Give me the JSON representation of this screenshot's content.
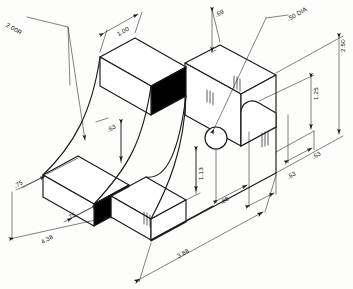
{
  "drawing": {
    "type": "isometric-engineering-drawing",
    "title": "Isometric pictorial of curved bracket with dimensions",
    "units": "inches",
    "background_color": "#fdfdfb",
    "line_color": "#1a1a1a",
    "fill_dark_color": "#000000",
    "fill_light_color": "#ffffff"
  },
  "dimensions": [
    {
      "id": "radius-2-00",
      "label": "2.00R",
      "kind": "radius",
      "value": 2.0,
      "position": "upper-left"
    },
    {
      "id": "width-1-00",
      "label": "1.00",
      "kind": "linear",
      "value": 1.0,
      "position": "top-center"
    },
    {
      "id": "height-0-69-top",
      "label": ".69",
      "kind": "linear",
      "value": 0.69,
      "position": "top-right"
    },
    {
      "id": "hole-50-dia",
      "label": ".50 DIA",
      "kind": "diameter",
      "value": 0.5,
      "position": "upper-right-leader"
    },
    {
      "id": "height-2-50",
      "label": "2.50",
      "kind": "linear",
      "value": 2.5,
      "position": "right-edge"
    },
    {
      "id": "height-1-25",
      "label": "1.25",
      "kind": "linear",
      "value": 1.25,
      "position": "right-inner"
    },
    {
      "id": "depth-0-63-arc",
      "label": ".63",
      "kind": "linear",
      "value": 0.63,
      "position": "center-arc"
    },
    {
      "id": "height-1-13",
      "label": "1.13",
      "kind": "linear",
      "value": 1.13,
      "position": "center-lower"
    },
    {
      "id": "width-0-88",
      "label": ".88",
      "kind": "linear",
      "value": 0.88,
      "position": "bottom-right-inner"
    },
    {
      "id": "depth-0-63-right",
      "label": ".63",
      "kind": "linear",
      "value": 0.63,
      "position": "right-lower"
    },
    {
      "id": "depth-0-63-far-right",
      "label": ".63",
      "kind": "linear",
      "value": 0.63,
      "position": "far-right"
    },
    {
      "id": "width-0-75-left",
      "label": ".75",
      "kind": "linear",
      "value": 0.75,
      "position": "left-lower"
    },
    {
      "id": "width-0-75-mid",
      "label": ".75",
      "kind": "linear",
      "value": 0.75,
      "position": "bottom-left-inner"
    },
    {
      "id": "length-4-38",
      "label": "4.38",
      "kind": "linear",
      "value": 4.38,
      "position": "bottom-left"
    },
    {
      "id": "length-3-88",
      "label": "3.88",
      "kind": "linear",
      "value": 3.88,
      "position": "bottom-center"
    }
  ]
}
